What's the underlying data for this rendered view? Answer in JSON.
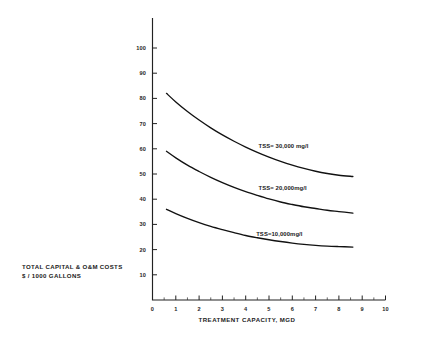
{
  "chart_data": {
    "type": "line",
    "title": "",
    "subtitle": "",
    "xlabel": "TREATMENT CAPACITY, MGD",
    "ylabel": "TOTAL CAPITAL & O&M COSTS\n$ / 1000 GALLONS",
    "ylabel_line1": "TOTAL CAPITAL & O&M COSTS",
    "ylabel_line2": "$ / 1000 GALLONS",
    "xlim": [
      0,
      10
    ],
    "ylim": [
      0,
      108
    ],
    "grid": false,
    "legend_position": "inline-right-of-curves",
    "x_ticks": [
      0,
      1,
      2,
      3,
      4,
      5,
      6,
      7,
      8,
      9,
      10
    ],
    "x_tick_labels": [
      "0",
      "1",
      "2",
      "3",
      "4",
      "5",
      "6",
      "7",
      "8",
      "9",
      "10"
    ],
    "x_minor_ticks": [
      0.5,
      1.5,
      2.5,
      3.5,
      4.5,
      5.5,
      6.5,
      7.5,
      8.5,
      9.5
    ],
    "y_ticks": [
      10,
      20,
      30,
      40,
      50,
      60,
      70,
      80,
      90,
      100
    ],
    "y_tick_labels": [
      "10",
      "20",
      "30",
      "40",
      "50",
      "60",
      "70",
      "80",
      "90",
      "100"
    ],
    "x": [
      0.6,
      1.0,
      1.5,
      2.0,
      2.5,
      3.0,
      3.5,
      4.0,
      4.5,
      5.0,
      5.5,
      6.0,
      6.5,
      7.0,
      7.5,
      8.0,
      8.6
    ],
    "series": [
      {
        "name": "TSS = 30,000 mg/l",
        "label": "TSS= 30,000 mg/l",
        "values": [
          82.0,
          78.6,
          74.8,
          71.4,
          68.3,
          65.5,
          63.0,
          60.7,
          58.6,
          56.7,
          55.0,
          53.5,
          52.2,
          51.1,
          50.2,
          49.5,
          49.0
        ]
      },
      {
        "name": "TSS = 20,000 mg/l",
        "label": "TSS= 20,000mg/l",
        "values": [
          59.0,
          56.4,
          53.5,
          51.0,
          48.7,
          46.6,
          44.7,
          43.0,
          41.5,
          40.1,
          38.9,
          37.9,
          37.0,
          36.3,
          35.6,
          35.1,
          34.5
        ]
      },
      {
        "name": "TSS = 10,000 mg/l",
        "label": "TSS=10,000mg/l",
        "values": [
          36.0,
          34.3,
          32.4,
          30.7,
          29.2,
          27.9,
          26.7,
          25.6,
          24.7,
          23.9,
          23.2,
          22.6,
          22.1,
          21.7,
          21.4,
          21.2,
          21.0
        ]
      }
    ],
    "annotations": [
      {
        "text": "TSS= 30,000 mg/l",
        "x": 4.55,
        "y": 60.5
      },
      {
        "text": "TSS= 20,000mg/l",
        "x": 4.55,
        "y": 43.5
      },
      {
        "text": "TSS=10,000mg/l",
        "x": 4.45,
        "y": 25.5
      }
    ],
    "colors": {
      "line": "#111111",
      "axis": "#222222",
      "text": "#1a1a1a",
      "background": "#ffffff"
    }
  }
}
